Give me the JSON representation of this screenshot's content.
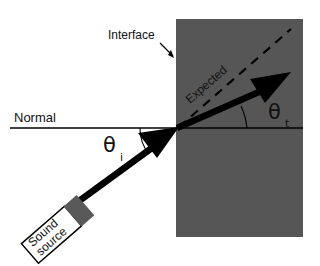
{
  "figure": {
    "type": "physics-ray-diagram",
    "width": 320,
    "height": 266,
    "background_color": "#ffffff"
  },
  "labels": {
    "normal": "Normal",
    "interface": "Interface",
    "expected": "Expected",
    "theta_symbol": "θ",
    "theta_incident_subscript": "i",
    "theta_transmitted_subscript": "t"
  },
  "source_box": {
    "line1": "Sound",
    "line2": "source",
    "fill_color": "#ffffff",
    "stroke_color": "#000000",
    "face_color": "#595959",
    "rotation_deg": -41
  },
  "medium_block": {
    "name": "second-medium",
    "fill_color": "#565656",
    "x": 176,
    "y": 19,
    "width": 127,
    "height": 218
  },
  "geometry": {
    "interface_point": {
      "x": 177,
      "y": 128
    },
    "normal_line": {
      "x1": 10,
      "y1": 128,
      "x2": 303,
      "y2": 128
    },
    "incident_ray": {
      "x1": 74,
      "y1": 206,
      "x2": 177,
      "y2": 128
    },
    "transmitted_ray": {
      "x1": 177,
      "y1": 128,
      "x2": 286,
      "y2": 80
    },
    "expected_ray": {
      "x1": 177,
      "y1": 128,
      "x2": 290,
      "y2": 29
    },
    "theta_incident_deg": 37,
    "theta_transmitted_deg": 24
  },
  "colors": {
    "ink": "#000000",
    "medium_gray": "#565656",
    "transducer_gray": "#595959",
    "paper": "#ffffff"
  }
}
